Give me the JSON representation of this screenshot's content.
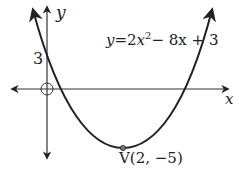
{
  "figure": {
    "type": "parabola_graph",
    "equation_label": "y = 2x² − 8x + 3",
    "equation_parts": {
      "lhs": "y",
      "eq": "=",
      "coef": "2",
      "var": "x",
      "exp": "2",
      "rest": "− 8x + 3"
    },
    "x_axis_label": "x",
    "y_axis_label": "y",
    "y_intercept_label": "3",
    "vertex_label": "V(2, −5)",
    "colors": {
      "curve": "#222222",
      "axis": "#333333",
      "background": "#ffffff"
    }
  }
}
